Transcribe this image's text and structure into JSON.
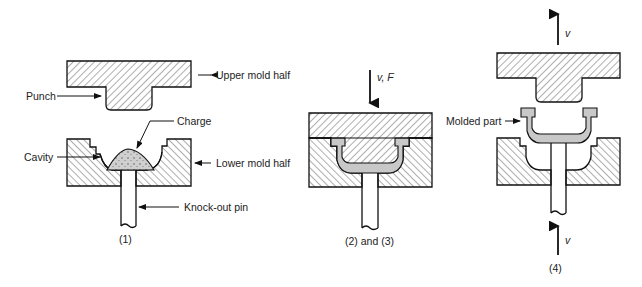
{
  "diagram": {
    "type": "process-stages",
    "colors": {
      "line": "#111111",
      "hatch": "#333333",
      "part": "#c8c8c8",
      "charge": "#cfcfcf"
    },
    "stage1": {
      "caption": "(1)",
      "labels": {
        "upper_mold": "Upper mold half",
        "punch": "Punch",
        "charge": "Charge",
        "cavity": "Cavity",
        "lower_mold": "Lower mold half",
        "knockout_pin": "Knock-out pin"
      }
    },
    "stage2": {
      "caption": "(2) and (3)",
      "arrow_label": "v, F"
    },
    "stage3": {
      "caption": "(4)",
      "top_arrow_label": "v",
      "bottom_arrow_label": "v",
      "labels": {
        "molded_part": "Molded part"
      }
    }
  }
}
